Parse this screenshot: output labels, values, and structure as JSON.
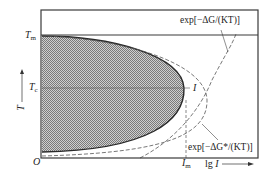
{
  "diagram": {
    "type": "TTT-style nucleation rate diagram",
    "y_axis": {
      "label": "T",
      "arrow": "up-arrow",
      "ticks": [
        {
          "symbol": "T",
          "subscript": "m",
          "meaning": "melting temperature"
        },
        {
          "symbol": "T",
          "subscript": "c",
          "meaning": "critical / peak temperature"
        }
      ]
    },
    "x_axis": {
      "label": "lg I",
      "arrow": "right-arrow",
      "ticks": [
        {
          "symbol": "I",
          "subscript": "m",
          "meaning": "maximum nucleation rate"
        }
      ]
    },
    "origin_label": "O",
    "curves": [
      {
        "name": "nucleation-rate-I",
        "style": "solid bold",
        "label": "I",
        "region": "shaded (cross-hatched) area to the left"
      },
      {
        "name": "exp-diffusion-term",
        "style": "dashed",
        "label": "exp[−ΔG/(KT)]"
      },
      {
        "name": "exp-barrier-term",
        "style": "dashed",
        "label": "exp[−ΔG*/(KT)]"
      }
    ],
    "reference_lines": [
      {
        "name": "Tm-line",
        "style": "solid horizontal"
      },
      {
        "name": "Tc-line",
        "style": "thin horizontal"
      },
      {
        "name": "Im-line",
        "style": "dashed vertical"
      }
    ]
  },
  "labels": {
    "Tm": {
      "main": "T",
      "sub": "m"
    },
    "Tc": {
      "main": "T",
      "sub": "c"
    },
    "T_axis": "T",
    "origin": "O",
    "Im": {
      "main": "I",
      "sub": "m"
    },
    "x_axis_label": {
      "prefix": "lg ",
      "var": "I"
    },
    "I_curve": "I",
    "formula_top": "exp[−ΔG/(KT)]",
    "formula_bottom": "exp[−ΔG*/(KT)]"
  },
  "colors": {
    "frame": "#3a3a3a",
    "hatch_fill": "#8a8a8a",
    "hatch_bg": "#cfcfcf",
    "curve": "#2a2a2a",
    "dashed": "#555555",
    "text": "#222222"
  }
}
